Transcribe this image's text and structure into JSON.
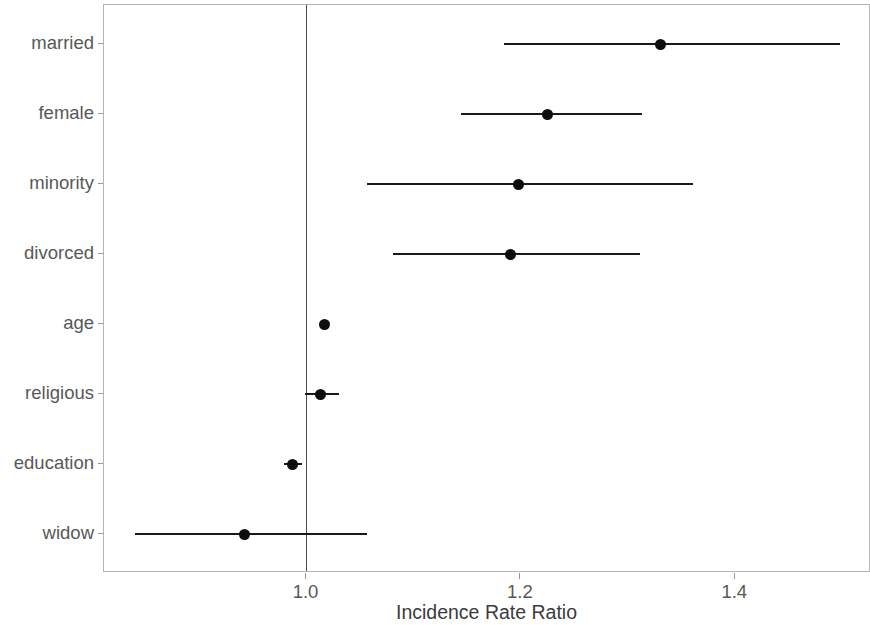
{
  "chart_data": {
    "type": "scatter",
    "subtype": "forest-plot",
    "title": "",
    "xlabel": "Incidence Rate Ratio",
    "ylabel": "",
    "xticks": [
      "1.0",
      "1.2",
      "1.4"
    ],
    "xtick_values": [
      1.0,
      1.2,
      1.4
    ],
    "xlim": [
      0.82,
      1.53
    ],
    "grid": false,
    "legend": null,
    "reference_line": 1.0,
    "categories": [
      "married",
      "female",
      "minority",
      "divorced",
      "age",
      "religious",
      "education",
      "widow"
    ],
    "values": [
      1.33,
      1.225,
      1.198,
      1.19,
      1.017,
      1.013,
      0.987,
      0.942
    ],
    "ci_low": [
      1.184,
      1.144,
      1.056,
      1.081,
      1.013,
      0.999,
      0.979,
      0.84
    ],
    "ci_high": [
      1.498,
      1.313,
      1.361,
      1.311,
      1.021,
      1.03,
      0.996,
      1.056
    ],
    "points": [
      {
        "label": "married",
        "estimate": 1.33,
        "ci_low": 1.184,
        "ci_high": 1.498
      },
      {
        "label": "female",
        "estimate": 1.225,
        "ci_low": 1.144,
        "ci_high": 1.313
      },
      {
        "label": "minority",
        "estimate": 1.198,
        "ci_low": 1.056,
        "ci_high": 1.361
      },
      {
        "label": "divorced",
        "estimate": 1.19,
        "ci_low": 1.081,
        "ci_high": 1.311
      },
      {
        "label": "age",
        "estimate": 1.017,
        "ci_low": 1.013,
        "ci_high": 1.021
      },
      {
        "label": "religious",
        "estimate": 1.013,
        "ci_low": 0.999,
        "ci_high": 1.03
      },
      {
        "label": "education",
        "estimate": 0.987,
        "ci_low": 0.979,
        "ci_high": 0.996
      },
      {
        "label": "widow",
        "estimate": 0.942,
        "ci_low": 0.84,
        "ci_high": 1.056
      }
    ],
    "colors": {
      "point": "#0d0d0d",
      "line": "#1a1a1a",
      "reference_line": "#4a4a4a",
      "panel_border": "#b4b4b4",
      "axis_text": "#585858",
      "background": "#ffffff"
    }
  }
}
